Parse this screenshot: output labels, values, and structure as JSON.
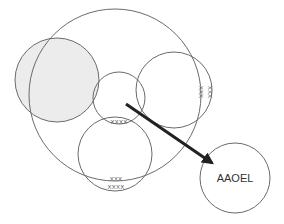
{
  "diagram": {
    "type": "venn-overlap-circles",
    "circles": [
      {
        "id": "big",
        "cx": 115,
        "cy": 95,
        "r": 86,
        "fill": "none"
      },
      {
        "id": "shaded-left",
        "cx": 57,
        "cy": 80,
        "r": 42,
        "fill": "#ececec"
      },
      {
        "id": "right",
        "cx": 174,
        "cy": 90,
        "r": 38,
        "fill": "none"
      },
      {
        "id": "center-small",
        "cx": 119,
        "cy": 98,
        "r": 26,
        "fill": "none"
      },
      {
        "id": "bottom",
        "cx": 115,
        "cy": 154,
        "r": 37,
        "fill": "none"
      },
      {
        "id": "target",
        "cx": 235,
        "cy": 178,
        "r": 35,
        "fill": "none"
      }
    ],
    "labels": {
      "right_xxx_1": "XXX",
      "right_xxx_2": "XXX",
      "center_xxxx": "XXXX",
      "bottom_xxx": "XXX",
      "bottom_xxxx": "XXXX",
      "target": "AAOEL"
    },
    "arrow": {
      "from": [
        126,
        104
      ],
      "to": [
        214,
        164
      ],
      "color": "#222222"
    },
    "stroke_color": "#6a6a6a",
    "shade_color": "#ececec"
  }
}
